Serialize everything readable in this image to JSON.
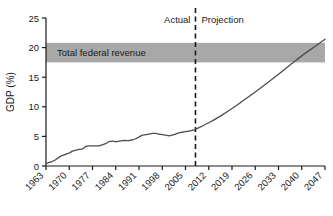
{
  "chart_data": {
    "type": "line",
    "title": "",
    "subtitle": "",
    "xlabel": "",
    "ylabel": "GDP (%)",
    "xlim": [
      1963,
      2047
    ],
    "ylim": [
      0,
      25
    ],
    "grid": false,
    "legend_position": "none",
    "x_ticks": [
      "1963",
      "1970",
      "1977",
      "1984",
      "1991",
      "1998",
      "2005",
      "2012",
      "2019",
      "2026",
      "2033",
      "2040",
      "2047"
    ],
    "y_ticks": [
      "0",
      "5",
      "10",
      "15",
      "20",
      "25"
    ],
    "series": [
      {
        "name": "Spending as share of GDP",
        "color": "#4d4d4d",
        "x": [
          1963,
          1964,
          1965,
          1966,
          1967,
          1968,
          1969,
          1970,
          1971,
          1972,
          1973,
          1974,
          1975,
          1976,
          1977,
          1978,
          1979,
          1980,
          1981,
          1982,
          1983,
          1984,
          1985,
          1986,
          1987,
          1988,
          1989,
          1990,
          1991,
          1992,
          1993,
          1994,
          1995,
          1996,
          1997,
          1998,
          1999,
          2000,
          2001,
          2002,
          2003,
          2004,
          2005,
          2006,
          2007,
          2008,
          2012,
          2016,
          2019,
          2022,
          2026,
          2030,
          2033,
          2037,
          2040,
          2044,
          2047
        ],
        "y": [
          0.4,
          0.6,
          0.8,
          1.1,
          1.5,
          1.8,
          2.0,
          2.2,
          2.5,
          2.7,
          2.8,
          2.9,
          3.3,
          3.4,
          3.4,
          3.4,
          3.4,
          3.6,
          3.8,
          4.1,
          4.2,
          4.1,
          4.2,
          4.3,
          4.3,
          4.3,
          4.4,
          4.6,
          4.9,
          5.2,
          5.3,
          5.4,
          5.5,
          5.5,
          5.4,
          5.3,
          5.2,
          5.1,
          5.2,
          5.4,
          5.6,
          5.7,
          5.8,
          5.9,
          6.0,
          6.2,
          7.3,
          8.6,
          9.7,
          10.9,
          12.5,
          14.2,
          15.5,
          17.3,
          18.6,
          20.2,
          21.4
        ]
      }
    ],
    "shaded_band": {
      "label": "Total federal revenue",
      "y_min": 17.5,
      "y_max": 20.8,
      "color": "#a8a8a8"
    },
    "annotations": [
      {
        "name": "actual-label",
        "text": "Actual",
        "x": 2002,
        "y": 24.2
      },
      {
        "name": "projection-label",
        "text": "Projection",
        "x": 2013,
        "y": 24.2
      }
    ],
    "divider": {
      "name": "actual-projection-divider",
      "x": 2008,
      "style": "dashed",
      "color": "#1a1a1a"
    }
  }
}
